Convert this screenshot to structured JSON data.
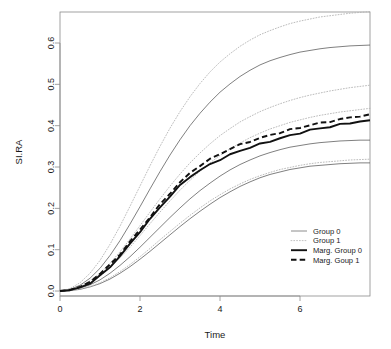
{
  "chart_data": {
    "type": "line",
    "title": "",
    "xlabel": "Time",
    "ylabel": "SI.RA",
    "xlim": [
      0,
      7.75
    ],
    "ylim": [
      -0.012,
      0.675
    ],
    "grid": false,
    "legend_position": "bottom-right",
    "xticks": [
      "0",
      "2",
      "4",
      "6"
    ],
    "xtick_values": [
      0,
      2,
      4,
      6
    ],
    "yticks": [
      "0.0",
      "0.1",
      "0.2",
      "0.3",
      "0.4",
      "0.5",
      "0.6"
    ],
    "ytick_values": [
      0.0,
      0.1,
      0.2,
      0.3,
      0.4,
      0.5,
      0.6
    ],
    "x": [
      0,
      0.25,
      0.5,
      0.75,
      1,
      1.25,
      1.5,
      1.75,
      2,
      2.25,
      2.5,
      2.75,
      3,
      3.25,
      3.5,
      3.75,
      4,
      4.25,
      4.5,
      4.75,
      5,
      5.25,
      5.5,
      5.75,
      6,
      6.25,
      6.5,
      6.75,
      7,
      7.25,
      7.5,
      7.75
    ],
    "series": [
      {
        "name": "Group 0 upper CI",
        "legend_group": "Group 0",
        "style": "solid-thin",
        "color": "#555555",
        "values": [
          0.0,
          0.004,
          0.014,
          0.031,
          0.055,
          0.086,
          0.122,
          0.162,
          0.204,
          0.247,
          0.289,
          0.329,
          0.366,
          0.4,
          0.43,
          0.457,
          0.481,
          0.501,
          0.519,
          0.534,
          0.547,
          0.557,
          0.565,
          0.572,
          0.578,
          0.582,
          0.586,
          0.589,
          0.591,
          0.593,
          0.594,
          0.595
        ]
      },
      {
        "name": "Group 0 mean",
        "legend_group": "Group 0",
        "style": "solid-thin",
        "color": "#555555",
        "values": [
          0.0,
          0.002,
          0.007,
          0.015,
          0.027,
          0.043,
          0.062,
          0.083,
          0.106,
          0.13,
          0.154,
          0.178,
          0.201,
          0.223,
          0.243,
          0.261,
          0.278,
          0.293,
          0.306,
          0.317,
          0.327,
          0.335,
          0.342,
          0.348,
          0.352,
          0.356,
          0.359,
          0.361,
          0.363,
          0.364,
          0.365,
          0.365
        ]
      },
      {
        "name": "Group 0 lower CI",
        "legend_group": "Group 0",
        "style": "solid-thin",
        "color": "#555555",
        "values": [
          0.0,
          0.001,
          0.004,
          0.01,
          0.018,
          0.029,
          0.043,
          0.059,
          0.077,
          0.096,
          0.116,
          0.136,
          0.156,
          0.175,
          0.193,
          0.21,
          0.226,
          0.24,
          0.253,
          0.264,
          0.274,
          0.282,
          0.288,
          0.294,
          0.298,
          0.302,
          0.304,
          0.306,
          0.308,
          0.309,
          0.31,
          0.31
        ]
      },
      {
        "name": "Group 1 upper CI",
        "legend_group": "Group 1",
        "style": "dotted-thin",
        "color": "#b4b4b4",
        "values": [
          0.0,
          0.006,
          0.02,
          0.043,
          0.074,
          0.113,
          0.157,
          0.205,
          0.254,
          0.303,
          0.35,
          0.394,
          0.434,
          0.47,
          0.502,
          0.53,
          0.554,
          0.574,
          0.592,
          0.607,
          0.62,
          0.63,
          0.639,
          0.647,
          0.653,
          0.658,
          0.663,
          0.666,
          0.669,
          0.672,
          0.674,
          0.676
        ]
      },
      {
        "name": "Group 1 mean",
        "legend_group": "Group 1",
        "style": "dotted-thin",
        "color": "#b4b4b4",
        "values": [
          0.0,
          0.003,
          0.011,
          0.025,
          0.043,
          0.067,
          0.095,
          0.126,
          0.158,
          0.191,
          0.223,
          0.254,
          0.283,
          0.31,
          0.334,
          0.356,
          0.376,
          0.393,
          0.409,
          0.422,
          0.434,
          0.444,
          0.453,
          0.461,
          0.468,
          0.474,
          0.479,
          0.484,
          0.488,
          0.492,
          0.495,
          0.498
        ]
      },
      {
        "name": "Group 1 lower CI",
        "legend_group": "Group 1",
        "style": "dotted-thin",
        "color": "#b4b4b4",
        "values": [
          0.0,
          0.002,
          0.009,
          0.02,
          0.036,
          0.056,
          0.08,
          0.106,
          0.134,
          0.163,
          0.191,
          0.218,
          0.244,
          0.268,
          0.29,
          0.31,
          0.328,
          0.344,
          0.358,
          0.371,
          0.382,
          0.392,
          0.4,
          0.408,
          0.414,
          0.42,
          0.425,
          0.429,
          0.433,
          0.436,
          0.439,
          0.442
        ]
      },
      {
        "name": "Group 1 low band",
        "legend_group": "Group 1",
        "style": "dotted-thin",
        "color": "#b4b4b4",
        "values": [
          0.0,
          0.001,
          0.005,
          0.011,
          0.02,
          0.032,
          0.047,
          0.064,
          0.083,
          0.103,
          0.124,
          0.144,
          0.164,
          0.183,
          0.201,
          0.218,
          0.233,
          0.247,
          0.259,
          0.27,
          0.279,
          0.287,
          0.294,
          0.299,
          0.304,
          0.308,
          0.311,
          0.313,
          0.315,
          0.317,
          0.318,
          0.319
        ]
      },
      {
        "name": "Marg. Group 0",
        "legend_group": "Marg. Group 0",
        "style": "solid-thick",
        "color": "#111111",
        "values": [
          0.0,
          0.002,
          0.009,
          0.021,
          0.038,
          0.06,
          0.086,
          0.114,
          0.144,
          0.173,
          0.201,
          0.228,
          0.253,
          0.275,
          0.291,
          0.305,
          0.318,
          0.33,
          0.34,
          0.349,
          0.357,
          0.364,
          0.371,
          0.377,
          0.383,
          0.389,
          0.393,
          0.396,
          0.401,
          0.405,
          0.408,
          0.411
        ]
      },
      {
        "name": "Marg. Goup 1",
        "legend_group": "Marg. Goup 1",
        "style": "dashed-thick",
        "color": "#111111",
        "values": [
          0.0,
          0.003,
          0.01,
          0.023,
          0.041,
          0.064,
          0.091,
          0.12,
          0.151,
          0.181,
          0.21,
          0.238,
          0.263,
          0.285,
          0.303,
          0.317,
          0.33,
          0.342,
          0.352,
          0.361,
          0.369,
          0.377,
          0.384,
          0.391,
          0.397,
          0.403,
          0.408,
          0.412,
          0.416,
          0.42,
          0.423,
          0.425
        ]
      }
    ],
    "legend": [
      {
        "label": "Group 0",
        "style": "solid-thin",
        "color": "#666666"
      },
      {
        "label": "Group 1",
        "style": "dotted-thin",
        "color": "#bbbbbb"
      },
      {
        "label": "Marg. Group 0",
        "style": "solid-thick",
        "color": "#111111"
      },
      {
        "label": "Marg. Goup 1",
        "style": "dashed-thick",
        "color": "#111111"
      }
    ]
  }
}
